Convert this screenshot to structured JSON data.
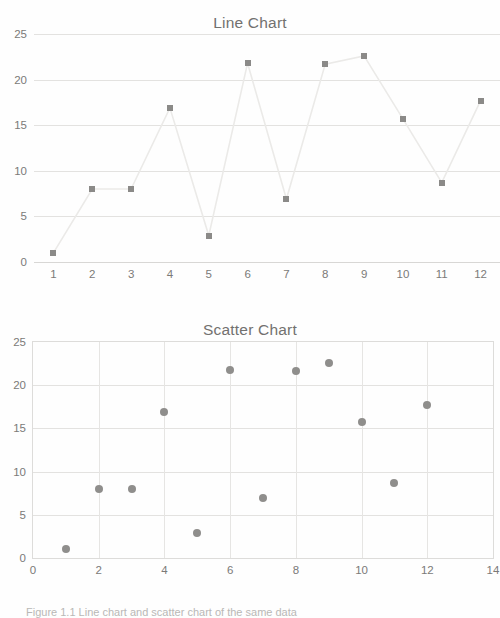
{
  "page": {
    "background_color": "#ffffff",
    "text_color": "#6d6d6d"
  },
  "caption": {
    "text": "Figure 1.1 Line chart and scatter chart of the same data"
  },
  "charts": [
    {
      "id": "line-chart",
      "title": "Line Chart"
    },
    {
      "id": "scatter-chart",
      "title": "Scatter Chart"
    }
  ],
  "chart_data": [
    {
      "type": "line",
      "title": "Line Chart",
      "xlabel": "",
      "ylabel": "",
      "categories": [
        1,
        2,
        3,
        4,
        5,
        6,
        7,
        8,
        9,
        10,
        11,
        12
      ],
      "values": [
        1.0,
        8.0,
        8.0,
        16.9,
        2.9,
        21.8,
        6.9,
        21.7,
        22.6,
        15.7,
        8.7,
        17.7
      ],
      "xtick_labels": [
        "1",
        "2",
        "3",
        "4",
        "5",
        "6",
        "7",
        "8",
        "9",
        "10",
        "11",
        "12"
      ],
      "ytick_labels": [
        "0",
        "5",
        "10",
        "15",
        "20",
        "25"
      ],
      "yticks": [
        0,
        5,
        10,
        15,
        20,
        25
      ],
      "ylim": [
        0,
        25
      ],
      "grid": "horizontal",
      "legend": "none",
      "marker": "square",
      "marker_color": "#8b8a88",
      "line_color": "#ebeae8"
    },
    {
      "type": "scatter",
      "title": "Scatter Chart",
      "xlabel": "",
      "ylabel": "",
      "x": [
        1,
        2,
        3,
        4,
        5,
        6,
        7,
        8,
        9,
        10,
        11,
        12
      ],
      "y": [
        1.0,
        8.0,
        8.0,
        16.9,
        2.9,
        21.8,
        6.9,
        21.7,
        22.6,
        15.7,
        8.7,
        17.7
      ],
      "xtick_labels": [
        "0",
        "2",
        "4",
        "6",
        "8",
        "10",
        "12",
        "14"
      ],
      "xticks": [
        0,
        2,
        4,
        6,
        8,
        10,
        12,
        14
      ],
      "ytick_labels": [
        "0",
        "5",
        "10",
        "15",
        "20",
        "25"
      ],
      "yticks": [
        0,
        5,
        10,
        15,
        20,
        25
      ],
      "xlim": [
        0,
        14
      ],
      "ylim": [
        0,
        25
      ],
      "grid": "both",
      "legend": "none",
      "marker": "circle",
      "marker_color": "#8f8e8c"
    }
  ]
}
